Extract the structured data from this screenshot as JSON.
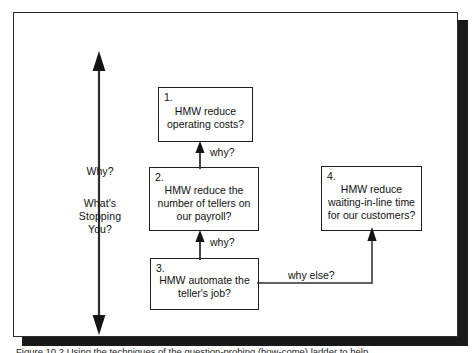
{
  "figure": {
    "axis": {
      "arrow_icon": "double-headed-vertical-arrow",
      "top_label": "Why?",
      "bottom_label": "What's\nStopping\nYou?"
    },
    "nodes": [
      {
        "id": "1",
        "number": "1.",
        "text": "HMW reduce\noperating costs?"
      },
      {
        "id": "2",
        "number": "2.",
        "text": "HMW reduce the\nnumber of tellers on\nour payroll?"
      },
      {
        "id": "3",
        "number": "3.",
        "text": "HMW automate the\nteller's job?"
      },
      {
        "id": "4",
        "number": "4.",
        "text": "HMW reduce\nwaiting-in-line time\nfor our customers?"
      }
    ],
    "edges": [
      {
        "id": "edge-1-2",
        "label": "why?",
        "from": "2",
        "to": "1",
        "icon": "arrow-up-icon"
      },
      {
        "id": "edge-2-3",
        "label": "why?",
        "from": "3",
        "to": "2",
        "icon": "arrow-up-icon"
      },
      {
        "id": "edge-3-4",
        "label": "why else?",
        "from": "3",
        "to": "4",
        "icon": "elbow-arrow-icon"
      }
    ],
    "caption": "Figure 10.2  Using the techniques of the question-probing (how-come) ladder to help",
    "colors": {
      "ink": "#111111",
      "border": "#1f1f1f",
      "background": "#ffffff",
      "shadow": "#1a1a1a"
    }
  }
}
